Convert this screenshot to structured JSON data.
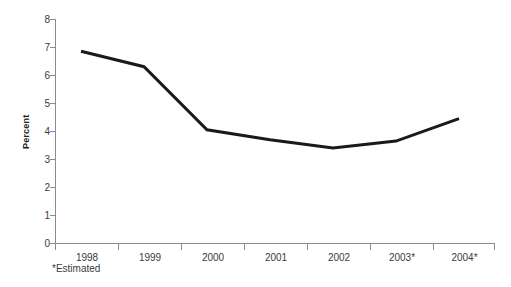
{
  "chart_data": {
    "type": "line",
    "title": "",
    "subtitle": "",
    "xlabel": "",
    "ylabel": "Percent",
    "categories": [
      "1998",
      "1999",
      "2000",
      "2001",
      "2002",
      "2003*",
      "2004*"
    ],
    "values": [
      6.85,
      6.3,
      4.05,
      3.7,
      3.4,
      3.65,
      4.45
    ],
    "series": [
      {
        "name": "Percent",
        "values": [
          6.85,
          6.3,
          4.05,
          3.7,
          3.4,
          3.65,
          4.45
        ]
      }
    ],
    "ylim": [
      0,
      8
    ],
    "yticks": [
      0,
      1,
      2,
      3,
      4,
      5,
      6,
      7,
      8
    ],
    "ytick_labels": [
      "0",
      "1",
      "2",
      "3",
      "4",
      "5",
      "6",
      "7",
      "8"
    ],
    "grid": false,
    "legend": false,
    "legend_position": "none",
    "annotations": [
      "*Estimated"
    ],
    "line_color": "#1a1a1a",
    "axis_color": "#8c8c8c",
    "background_color": "#ffffff"
  },
  "axis": {
    "y_label": "Percent",
    "footnote": "*Estimated"
  }
}
